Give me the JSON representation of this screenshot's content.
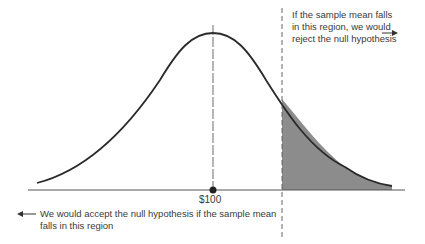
{
  "diagram": {
    "type": "normal-distribution-hypothesis-test",
    "mean_label": "$100",
    "reject_text": "If the sample mean falls in this region, we would reject the null hypothesis",
    "accept_text": "We would accept the null hypothesis if the sample mean falls in this region",
    "colors": {
      "curve": "#2a2a2a",
      "shaded": "#8c8c8c",
      "axis": "#555555"
    }
  }
}
